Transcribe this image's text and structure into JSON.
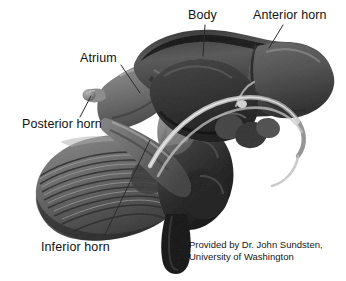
{
  "figure": {
    "kind": "anatomical-illustration",
    "background_color": "#ffffff",
    "ink_color": "#111111",
    "leader_line_color": "#2b2b2b"
  },
  "labels": [
    {
      "id": "body",
      "text": "Body",
      "x": 188,
      "y": 9,
      "leader": {
        "x1": 205,
        "y1": 25,
        "x2": 203,
        "y2": 56
      }
    },
    {
      "id": "anterior-horn",
      "text": "Anterior horn",
      "x": 253,
      "y": 9,
      "leader": {
        "x1": 283,
        "y1": 25,
        "x2": 269,
        "y2": 48
      }
    },
    {
      "id": "atrium",
      "text": "Atrium",
      "x": 80,
      "y": 52,
      "leader": {
        "x1": 121,
        "y1": 65,
        "x2": 140,
        "y2": 93
      }
    },
    {
      "id": "posterior-horn",
      "text": "Posterior horn",
      "x": 22,
      "y": 118,
      "leader": {
        "x1": 80,
        "y1": 117,
        "x2": 91,
        "y2": 96
      }
    },
    {
      "id": "inferior-horn",
      "text": "Inferior horn",
      "x": 41,
      "y": 241,
      "leader": {
        "x1": 103,
        "y1": 239,
        "x2": 150,
        "y2": 140
      }
    }
  ],
  "credit": {
    "line1": "Provided by Dr. John Sundsten,",
    "line2": "University of Washington",
    "x": 189,
    "y": 239
  },
  "structures": [
    {
      "id": "lateral-ventricle-body",
      "name": "Body of lateral ventricle"
    },
    {
      "id": "anterior-horn-structure",
      "name": "Anterior horn of lateral ventricle"
    },
    {
      "id": "atrium-structure",
      "name": "Atrium (trigone) of lateral ventricle"
    },
    {
      "id": "posterior-horn-structure",
      "name": "Posterior (occipital) horn"
    },
    {
      "id": "inferior-horn-structure",
      "name": "Inferior (temporal) horn"
    },
    {
      "id": "thalamus",
      "name": "Thalamus"
    },
    {
      "id": "fornix",
      "name": "Fornix"
    },
    {
      "id": "cerebellum",
      "name": "Cerebellum"
    },
    {
      "id": "brainstem",
      "name": "Brainstem"
    },
    {
      "id": "fourth-ventricle",
      "name": "Fourth ventricle"
    }
  ]
}
